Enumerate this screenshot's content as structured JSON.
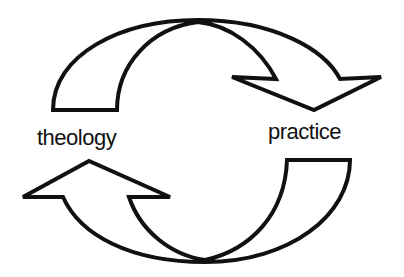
{
  "diagram": {
    "type": "cycle",
    "nodes": [
      {
        "id": "theology",
        "label": "theology"
      },
      {
        "id": "practice",
        "label": "practice"
      }
    ],
    "edges": [
      {
        "from": "theology",
        "to": "practice",
        "shape": "curved-arrow",
        "position": "top"
      },
      {
        "from": "practice",
        "to": "theology",
        "shape": "curved-arrow",
        "position": "bottom"
      }
    ],
    "colors": {
      "stroke": "#111111",
      "fill": "#ffffff",
      "background": "#ffffff"
    }
  }
}
